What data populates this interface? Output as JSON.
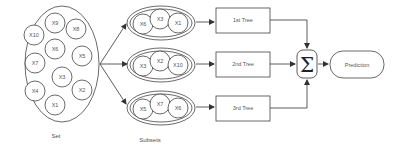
{
  "set": {
    "label": "Set",
    "items": [
      {
        "label": "X9",
        "cx": 55,
        "cy": 23
      },
      {
        "label": "X8",
        "cx": 76,
        "cy": 29
      },
      {
        "label": "X10",
        "cx": 34,
        "cy": 35
      },
      {
        "label": "X6",
        "cx": 55,
        "cy": 49
      },
      {
        "label": "X5",
        "cx": 82,
        "cy": 56
      },
      {
        "label": "X7",
        "cx": 35,
        "cy": 63
      },
      {
        "label": "X3",
        "cx": 62,
        "cy": 77
      },
      {
        "label": "X2",
        "cx": 82,
        "cy": 90
      },
      {
        "label": "X4",
        "cx": 35,
        "cy": 91
      },
      {
        "label": "X1",
        "cx": 55,
        "cy": 105
      }
    ]
  },
  "subsets": {
    "label": "Subsets",
    "groups": [
      {
        "items": [
          "X6",
          "X3",
          "X1"
        ],
        "cy": 22
      },
      {
        "items": [
          "X3",
          "X2",
          "X10"
        ],
        "cy": 64
      },
      {
        "items": [
          "X5",
          "X7",
          "X6"
        ],
        "cy": 107
      }
    ]
  },
  "trees": [
    {
      "label": "1st Tree",
      "cy": 20
    },
    {
      "label": "2nd Tree",
      "cy": 64
    },
    {
      "label": "3rd Tree",
      "cy": 108
    }
  ],
  "aggregator": {
    "symbol": "Σ",
    "name": "sum"
  },
  "output": {
    "label": "Prediction"
  }
}
